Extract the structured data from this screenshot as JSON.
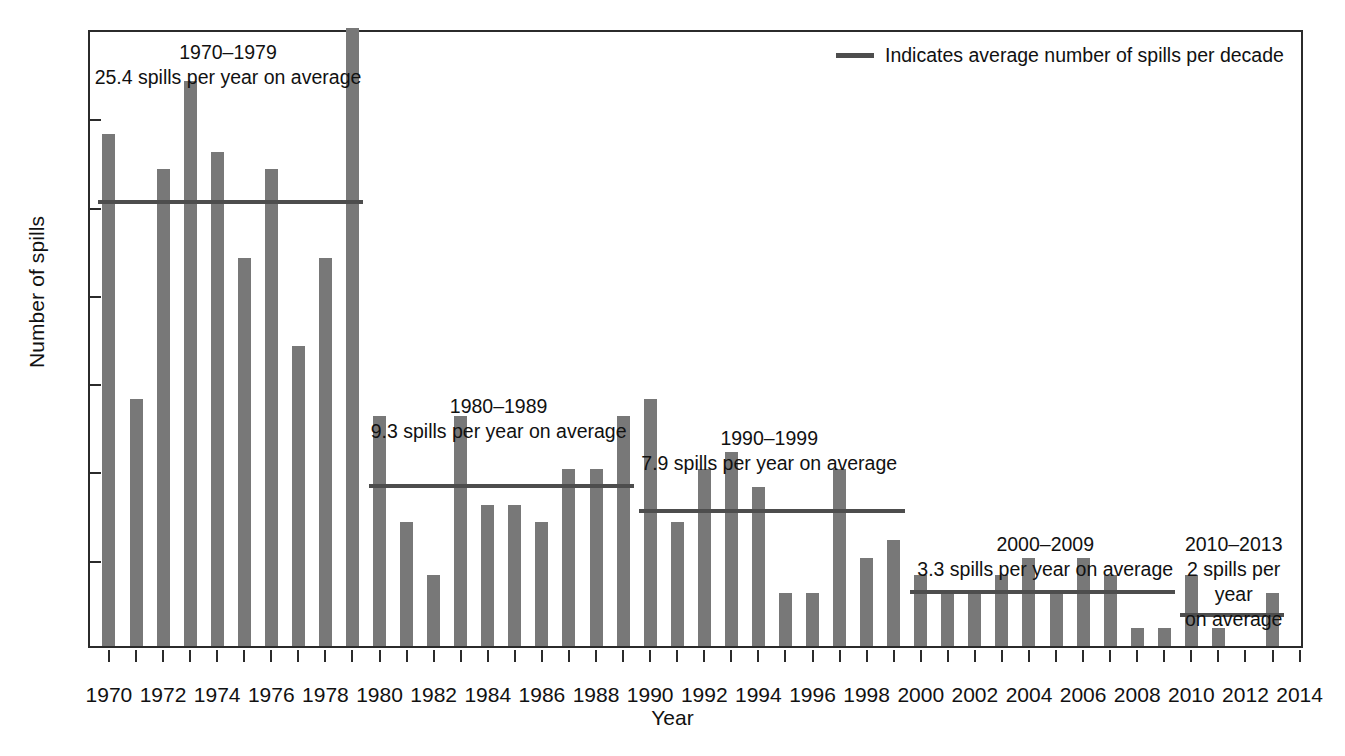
{
  "chart_data": {
    "type": "bar",
    "title": "",
    "xlabel": "Year",
    "ylabel": "Number of spills",
    "ylim": [
      0,
      35
    ],
    "ytick_values": [
      0,
      5,
      10,
      15,
      20,
      25,
      30,
      35
    ],
    "ytick_labels": [
      "0",
      "5",
      "10",
      "15",
      "20",
      "25",
      "30",
      "35"
    ],
    "xlim": [
      1969.3,
      2014.2
    ],
    "xtick_labels": [
      "1970",
      "1972",
      "1974",
      "1976",
      "1978",
      "1980",
      "1982",
      "1984",
      "1986",
      "1988",
      "1990",
      "1992",
      "1994",
      "1996",
      "1998",
      "2000",
      "2002",
      "2004",
      "2006",
      "2008",
      "2010",
      "2012",
      "2014"
    ],
    "grid": false,
    "bar_color": "#787878",
    "line_color": "#4d4d4d",
    "axis_color": "#2b2b2b",
    "categories": [
      1970,
      1971,
      1972,
      1973,
      1974,
      1975,
      1976,
      1977,
      1978,
      1979,
      1980,
      1981,
      1982,
      1983,
      1984,
      1985,
      1986,
      1987,
      1988,
      1989,
      1990,
      1991,
      1992,
      1993,
      1994,
      1995,
      1996,
      1997,
      1998,
      1999,
      2000,
      2001,
      2002,
      2003,
      2004,
      2005,
      2006,
      2007,
      2008,
      2009,
      2010,
      2011,
      2012,
      2013
    ],
    "values": [
      29,
      14,
      27,
      32,
      28,
      22,
      27,
      17,
      22,
      36,
      13,
      7,
      4,
      13,
      8,
      8,
      7,
      10,
      10,
      13,
      14,
      7,
      10,
      11,
      9,
      3,
      3,
      10,
      5,
      6,
      4,
      3,
      3,
      4,
      5,
      3,
      5,
      4,
      1,
      1,
      4,
      1,
      0,
      3
    ],
    "series_name": "Number of spills",
    "averages": [
      {
        "label": "1970–1979",
        "text": "25.4 spills per year on average",
        "value": 25.4,
        "start_year": 1970,
        "end_year": 1979
      },
      {
        "label": "1980–1989",
        "text": "9.3 spills per year on average",
        "value": 9.3,
        "start_year": 1980,
        "end_year": 1989
      },
      {
        "label": "1990–1999",
        "text": "7.9 spills per year on average",
        "value": 7.9,
        "start_year": 1990,
        "end_year": 1999
      },
      {
        "label": "2000–2009",
        "text": "3.3 spills per year on average",
        "value": 3.3,
        "start_year": 2000,
        "end_year": 2009
      },
      {
        "label": "2010–2013",
        "text": "2 spills per year on average",
        "value": 2,
        "start_year": 2010,
        "end_year": 2013
      }
    ],
    "legend": {
      "position": "top-right",
      "entries": [
        {
          "marker": "line",
          "label": "Indicates average number of spills per decade"
        }
      ]
    }
  },
  "annotations": [
    {
      "name": "annotation-1970s",
      "title": "1970–1979",
      "subtitle": "25.4 spills per year on average"
    },
    {
      "name": "annotation-1980s",
      "title": "1980–1989",
      "subtitle": "9.3 spills per year on average"
    },
    {
      "name": "annotation-1990s",
      "title": "1990–1999",
      "subtitle": "7.9 spills per year on average"
    },
    {
      "name": "annotation-2000s",
      "title": "2000–2009",
      "subtitle": "3.3 spills per year on average"
    },
    {
      "name": "annotation-2010s",
      "title": "2010–2013",
      "subtitle": "2 spills per year\non average"
    }
  ],
  "axis": {
    "y_title": "Number of spills",
    "x_title": "Year"
  },
  "legend": {
    "text": "Indicates average number of spills per decade",
    "marker_name": "average-line-swatch"
  }
}
